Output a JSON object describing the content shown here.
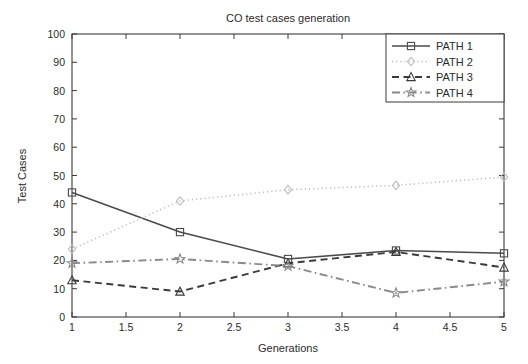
{
  "chart_data": {
    "type": "line",
    "title": "CO test cases  generation",
    "xlabel": "Generations",
    "ylabel": "Test Cases",
    "x": [
      1,
      2,
      3,
      4,
      5
    ],
    "xlim": [
      1,
      5
    ],
    "ylim": [
      0,
      100
    ],
    "xticks": [
      1,
      1.5,
      2,
      2.5,
      3,
      3.5,
      4,
      4.5,
      5
    ],
    "xticklabels": [
      "1",
      "1.5",
      "2",
      "2.5",
      "3",
      "3.5",
      "4",
      "4.5",
      "5"
    ],
    "yticks": [
      0,
      10,
      20,
      30,
      40,
      50,
      60,
      70,
      80,
      90,
      100
    ],
    "yticklabels": [
      "0",
      "10",
      "20",
      "30",
      "40",
      "50",
      "60",
      "70",
      "80",
      "90",
      "100"
    ],
    "grid": false,
    "legend_position": "top-right",
    "series": [
      {
        "name": "PATH 1",
        "values": [
          44,
          30,
          20.5,
          23.5,
          22.5
        ],
        "color": "#4a4a4a",
        "linestyle": "solid",
        "marker": "square"
      },
      {
        "name": "PATH 2",
        "values": [
          24,
          41,
          45,
          46.5,
          49.5
        ],
        "color": "#bdbdbd",
        "linestyle": "dotted",
        "marker": "diamond"
      },
      {
        "name": "PATH 3",
        "values": [
          13,
          9,
          19,
          23,
          17.5
        ],
        "color": "#3a3a3a",
        "linestyle": "dashed",
        "marker": "triangle"
      },
      {
        "name": "PATH 4",
        "values": [
          19,
          20.5,
          18,
          8.5,
          12.5
        ],
        "color": "#8a8a8a",
        "linestyle": "dashdot",
        "marker": "star"
      }
    ]
  },
  "legend": {
    "items": [
      {
        "label": "PATH 1"
      },
      {
        "label": "PATH 2"
      },
      {
        "label": "PATH 3"
      },
      {
        "label": "PATH 4"
      }
    ]
  },
  "axes": {
    "title": "CO test cases  generation",
    "x_axis_label": "Generations",
    "y_axis_label": "Test Cases"
  }
}
